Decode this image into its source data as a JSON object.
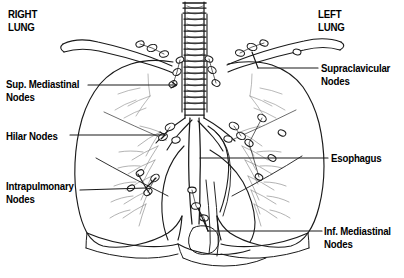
{
  "figure": {
    "width": 404,
    "height": 278,
    "background_color": "#ffffff",
    "line_color": "#1a1a1a",
    "style": "black-and-white line drawing"
  },
  "labels": {
    "right_lung": "RIGHT\nLUNG",
    "left_lung": "LEFT\nLUNG",
    "sup_mediastinal_nodes": "Sup. Mediastinal\nNodes",
    "hilar_nodes": "Hilar Nodes",
    "intrapulmonary_nodes": "Intrapulmonary\nNodes",
    "supraclavicular_nodes": "Supraclavicular\nNodes",
    "esophagus": "Esophagus",
    "inf_mediastinal_nodes": "Inf. Mediastinal\nNodes"
  },
  "anatomy": {
    "trachea": "trachea",
    "right_lung": "right lung",
    "left_lung": "left lung",
    "clavicle_right": "right clavicle",
    "clavicle_left": "left clavicle",
    "esophagus": "esophagus",
    "bronchi": "main bronchi",
    "lymph_nodes": "lymph nodes",
    "diaphragm": "diaphragm"
  }
}
